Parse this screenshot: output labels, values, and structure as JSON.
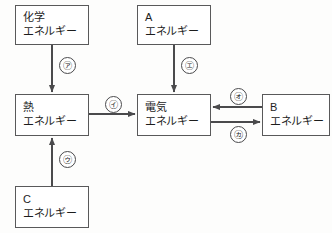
{
  "diagram": {
    "type": "energy-conversion-flow",
    "stroke_color": "#59595a",
    "background_color": "#fdfdfc",
    "nodes": [
      {
        "id": "chemical",
        "line1": "化学",
        "line2": "エネルギー",
        "x": 15,
        "y": 5,
        "w": 74,
        "h": 40
      },
      {
        "id": "a",
        "line1": "A",
        "line2": "エネルギー",
        "x": 137,
        "y": 5,
        "w": 74,
        "h": 40
      },
      {
        "id": "heat",
        "line1": "熱",
        "line2": "エネルギー",
        "x": 15,
        "y": 94,
        "w": 74,
        "h": 42
      },
      {
        "id": "electric",
        "line1": "電気",
        "line2": "エネルギー",
        "x": 137,
        "y": 94,
        "w": 74,
        "h": 42
      },
      {
        "id": "b",
        "line1": "B",
        "line2": "エネルギー",
        "x": 262,
        "y": 94,
        "w": 68,
        "h": 42
      },
      {
        "id": "c",
        "line1": "C",
        "line2": "エネルギー",
        "x": 15,
        "y": 186,
        "w": 74,
        "h": 42
      }
    ],
    "edges": [
      {
        "id": "edge-a",
        "from": "chemical",
        "to": "heat",
        "direction": "down",
        "label": "㋐"
      },
      {
        "id": "edge-i",
        "from": "heat",
        "to": "electric",
        "direction": "right",
        "label": "㋑"
      },
      {
        "id": "edge-u",
        "from": "c",
        "to": "heat",
        "direction": "up",
        "label": "㋒"
      },
      {
        "id": "edge-e",
        "from": "a",
        "to": "electric",
        "direction": "down",
        "label": "㋓"
      },
      {
        "id": "edge-o",
        "from": "b",
        "to": "electric",
        "direction": "left",
        "label": "㋔"
      },
      {
        "id": "edge-ka",
        "from": "electric",
        "to": "b",
        "direction": "right",
        "label": "㋕"
      }
    ],
    "labels": {
      "a": "㋐",
      "i": "㋑",
      "u": "㋒",
      "e": "㋓",
      "o": "㋔",
      "ka": "㋕"
    }
  }
}
